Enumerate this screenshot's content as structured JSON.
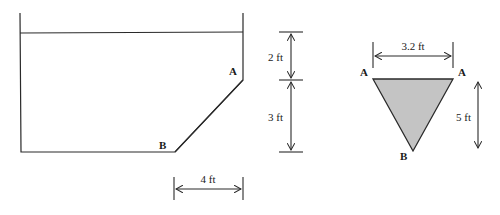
{
  "diagram": {
    "type": "engineering-figure",
    "colors": {
      "line": "#2a2a2a",
      "gate_fill": "#c4c4c4",
      "background": "#ffffff"
    },
    "tank_section": {
      "points": {
        "A": {
          "label": "A"
        },
        "B": {
          "label": "B"
        }
      },
      "dimensions": {
        "horizontal_offset": "4 ft",
        "depth_to_A": "2 ft",
        "depth_A_to_B": "3 ft"
      }
    },
    "gate_view": {
      "shape": "inverted triangle",
      "points": {
        "A_left": {
          "label": "A"
        },
        "A_right": {
          "label": "A"
        },
        "B": {
          "label": "B"
        }
      },
      "dimensions": {
        "width": "3.2 ft",
        "slant_height": "5 ft"
      }
    }
  }
}
